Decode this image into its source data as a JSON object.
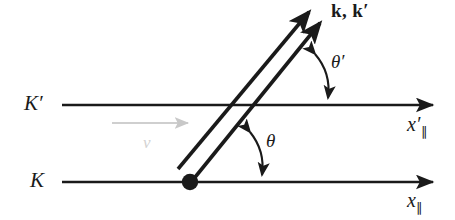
{
  "figure": {
    "type": "physics-diagram",
    "background_color": "#ffffff",
    "ink_color": "#1a1a1a",
    "velocity_color": "#b5b5b5",
    "width": 455,
    "height": 220
  },
  "frames": {
    "upper": {
      "name": "K'",
      "label": "K",
      "prime": "′",
      "axis_label_base": "x",
      "axis_label_prime": "′",
      "axis_label_sub": "∥",
      "axis_y": 105,
      "axis_x_start": 62,
      "axis_x_end": 437
    },
    "lower": {
      "name": "K",
      "label": "K",
      "prime": "",
      "axis_label_base": "x",
      "axis_label_prime": "",
      "axis_label_sub": "∥",
      "axis_y": 182,
      "axis_x_start": 62,
      "axis_x_end": 437
    }
  },
  "velocity": {
    "symbol": "v",
    "arrow_x_start": 112,
    "arrow_x_end": 192,
    "arrow_y": 123,
    "color": "#d2d2d2"
  },
  "source_point": {
    "name": "emission-point",
    "x": 190,
    "y": 182,
    "radius": 8
  },
  "wave_vectors": {
    "label": "k, k′",
    "label_k": "k",
    "label_k_prime": "k′",
    "separator": ", ",
    "arrow_1": {
      "x1": 190,
      "y1": 182,
      "x2": 322,
      "y2": 20
    },
    "arrow_2": {
      "x1": 178,
      "y1": 168,
      "x2": 311,
      "y2": 9
    },
    "angle_from_axis_deg": 50.8
  },
  "angles": [
    {
      "name": "theta",
      "symbol": "θ",
      "prime": "",
      "frame": "K",
      "vertex_x": 190,
      "vertex_y": 182,
      "label_x": 268,
      "label_y": 141
    },
    {
      "name": "theta-prime",
      "symbol": "θ",
      "prime": "′",
      "frame": "K'",
      "vertex_x": 258,
      "vertex_y": 105,
      "label_x": 333,
      "label_y": 62
    }
  ],
  "labels": {
    "frame_upper_x": 24,
    "frame_upper_y": 94,
    "frame_lower_x": 30,
    "frame_lower_y": 171,
    "axis_upper_x": 405,
    "axis_upper_y": 117,
    "axis_lower_x": 405,
    "axis_lower_y": 193,
    "wave_x": 333,
    "wave_y": 2
  }
}
